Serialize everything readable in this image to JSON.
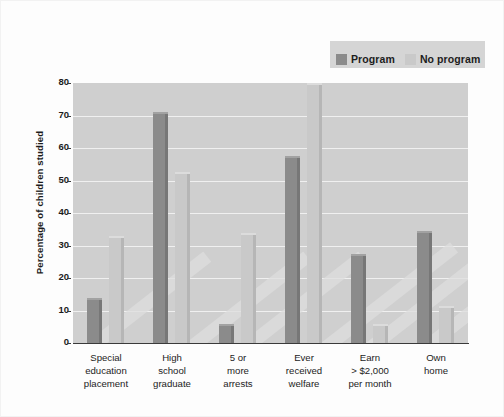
{
  "chart_data": {
    "type": "bar",
    "title": "",
    "xlabel": "",
    "ylabel": "Percentage of children studied",
    "ylim": [
      0,
      80
    ],
    "yticks": [
      0,
      10,
      20,
      30,
      40,
      50,
      60,
      70,
      80
    ],
    "grid": true,
    "legend_position": "top-right",
    "categories": [
      "Special education placement",
      "High school graduate",
      "5 or more arrests",
      "Ever received welfare",
      "Earn > $2,000 per month",
      "Own home"
    ],
    "category_lines": [
      [
        "Special",
        "education",
        "placement"
      ],
      [
        "High",
        "school",
        "graduate"
      ],
      [
        "5 or",
        "more",
        "arrests"
      ],
      [
        "Ever",
        "received",
        "welfare"
      ],
      [
        "Earn",
        "> $2,000",
        "per month"
      ],
      [
        "Own",
        "home"
      ]
    ],
    "series": [
      {
        "name": "Program",
        "color": "#8b8b8b",
        "values": [
          14,
          71,
          6,
          57.5,
          27.5,
          34.5
        ]
      },
      {
        "name": "No program",
        "color": "#c9c9c9",
        "values": [
          33,
          52.5,
          34,
          80,
          6,
          11.5
        ]
      }
    ]
  },
  "legend": {
    "entries": [
      {
        "label": "Program",
        "color": "#8b8b8b"
      },
      {
        "label": "No program",
        "color": "#c9c9c9"
      }
    ]
  },
  "colors": {
    "plot_background": "#cfcfcf",
    "gridline": "#f0f0f0",
    "axis": "#3a3a3a",
    "page_background": "#fdfdfd",
    "legend_background": "#d5d5d5"
  }
}
